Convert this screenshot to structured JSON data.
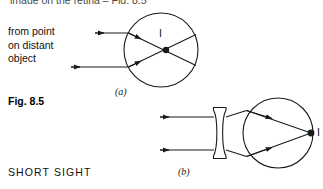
{
  "page": {
    "background_color": "#ffffff",
    "ink_color": "#1a1a1a",
    "width": 323,
    "height": 189
  },
  "clipped_header": {
    "text": "image on the retina – Fig. 8.5"
  },
  "figure": {
    "number_label": "Fig. 8.5",
    "topic_label": "SHORT SIGHT",
    "ray_source_label_lines": [
      "from point",
      "on distant",
      "object"
    ],
    "panels": [
      {
        "id": "a",
        "caption": "(a)",
        "image_point_label": "I",
        "description": "uncorrected short-sighted eye: parallel rays focus in front of the retina",
        "eye": {
          "cx": 161,
          "cy": 50,
          "r": 37
        },
        "rays": [
          {
            "y": 33,
            "x_start": 95,
            "x_end": 128
          },
          {
            "y": 67,
            "x_start": 95,
            "x_end": 128
          }
        ],
        "focus_point": {
          "x": 166,
          "y": 50
        }
      },
      {
        "id": "b",
        "caption": "(b)",
        "image_point_label": "I",
        "description": "corrected with a diverging (biconcave) lens so rays focus on the retina",
        "lens": {
          "type": "biconcave",
          "x": 213,
          "y": 106,
          "width": 13,
          "height": 54
        },
        "eye": {
          "cx": 278,
          "cy": 133,
          "r": 35
        },
        "rays": [
          {
            "y": 117,
            "x_start": 160,
            "x_end": 213
          },
          {
            "y": 150,
            "x_start": 160,
            "x_end": 213
          }
        ],
        "focus_point": {
          "x": 311,
          "y": 133
        }
      }
    ]
  }
}
